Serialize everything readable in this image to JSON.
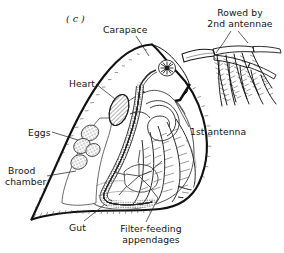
{
  "figure": {
    "panel_id": "( c )",
    "background_color": "#ffffff",
    "ink_color": "#141414"
  },
  "labels": {
    "carapace": "Carapace",
    "rowed_by_2nd_antennae_line1": "Rowed by",
    "rowed_by_2nd_antennae_line2": "2nd antennae",
    "heart": "Heart",
    "first_antenna": "1st antenna",
    "eggs": "Eggs",
    "brood_chamber_line1": "Brood",
    "brood_chamber_line2": "chamber",
    "gut": "Gut",
    "filter_feeding_line1": "Filter-feeding",
    "filter_feeding_line2": "appendages"
  }
}
